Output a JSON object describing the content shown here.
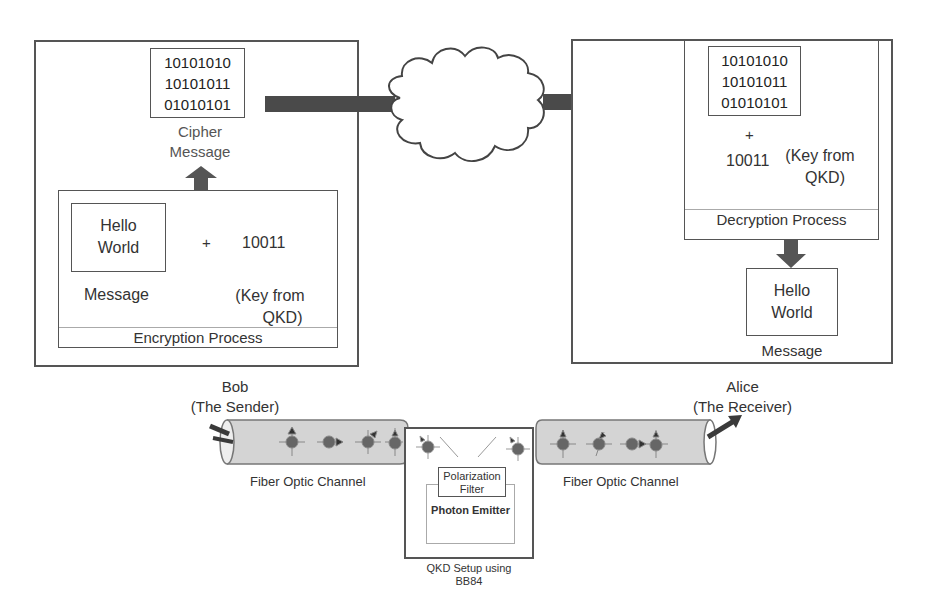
{
  "sender_panel": {
    "cipher_bits": [
      "10101010",
      "10101011",
      "01010101"
    ],
    "cipher_label_line1": "Cipher",
    "cipher_label_line2": "Message",
    "message_text_line1": "Hello",
    "message_text_line2": "World",
    "plus": "+",
    "key_value": "10011",
    "message_label": "Message",
    "key_label_line1": "(Key from",
    "key_label_line2": "QKD)",
    "process_label": "Encryption Process"
  },
  "receiver_panel": {
    "cipher_bits": [
      "10101010",
      "10101011",
      "01010101"
    ],
    "plus": "+",
    "key_value": "10011",
    "key_label_line1": "(Key from",
    "key_label_line2": "QKD)",
    "process_label": "Decryption Process",
    "message_text_line1": "Hello",
    "message_text_line2": "World",
    "message_label": "Message"
  },
  "network": {
    "icon": "cloud-icon"
  },
  "bob": {
    "name": "Bob",
    "role": "(The Sender)"
  },
  "alice": {
    "name": "Alice",
    "role": "(The Receiver)"
  },
  "left_channel": {
    "label": "Fiber Optic Channel"
  },
  "right_channel": {
    "label": "Fiber Optic Channel"
  },
  "qkd": {
    "filter_line1": "Polarization",
    "filter_line2": "Filter",
    "emitter": "Photon Emitter",
    "label_line1": "QKD Setup using",
    "label_line2": "BB84"
  },
  "colors": {
    "arrow": "#4a4a4a",
    "fiber": "#d4d4d4",
    "photon": "#666666",
    "border": "#555555"
  }
}
